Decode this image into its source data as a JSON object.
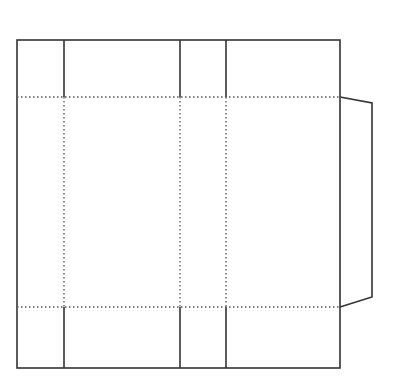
{
  "diagram": {
    "type": "box-net",
    "width": 411,
    "height": 389,
    "colors": {
      "cut_line": "#333333",
      "fold_line": "#555555",
      "background": "#ffffff"
    },
    "outline": {
      "left": 17,
      "top": 40,
      "right": 340,
      "bottom": 368
    },
    "vertical_lines_x": [
      64,
      180,
      226
    ],
    "horizontal_folds_y": [
      97,
      307
    ],
    "flap": {
      "points": [
        [
          340,
          97
        ],
        [
          372,
          103
        ],
        [
          372,
          297
        ],
        [
          340,
          307
        ]
      ]
    }
  }
}
